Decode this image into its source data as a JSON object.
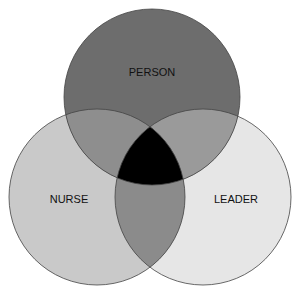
{
  "diagram": {
    "type": "venn",
    "sets": [
      {
        "id": "person",
        "label": "PERSON",
        "fill": "#6d6d6d",
        "cx": 152,
        "cy": 97,
        "r": 88
      },
      {
        "id": "nurse",
        "label": "NURSE",
        "fill": "#c9c9c9",
        "cx": 97,
        "cy": 197,
        "r": 88
      },
      {
        "id": "leader",
        "label": "LEADER",
        "fill": "#e6e6e6",
        "cx": 203,
        "cy": 197,
        "r": 88
      }
    ],
    "overlaps": {
      "person_nurse": "#8e8e8e",
      "person_leader": "#9a9a9a",
      "nurse_leader": "#8b8b8b",
      "all": "#000000"
    },
    "stroke": "#444444"
  }
}
